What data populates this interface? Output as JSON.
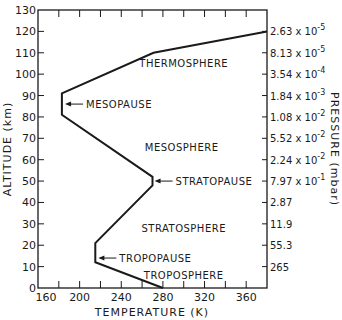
{
  "chart_data": {
    "type": "line",
    "title": "",
    "xlabel": "TEMPERATURE (K)",
    "ylabel": "ALTITUDE (km)",
    "y2label": "PRESSURE (mbar)",
    "xlim": [
      160,
      380
    ],
    "ylim": [
      0,
      130
    ],
    "grid": false,
    "x_ticks": [
      160,
      180,
      200,
      220,
      240,
      260,
      280,
      300,
      320,
      340,
      360,
      380
    ],
    "x_tick_labels": [
      "160",
      "200",
      "240",
      "280",
      "320",
      "360"
    ],
    "x_tick_label_values": [
      160,
      200,
      240,
      280,
      320,
      360
    ],
    "y_ticks": [
      0,
      10,
      20,
      30,
      40,
      50,
      60,
      70,
      80,
      90,
      100,
      110,
      120,
      130
    ],
    "y_tick_labels": [
      "0",
      "10",
      "20",
      "30",
      "40",
      "50",
      "60",
      "70",
      "80",
      "90",
      "100",
      "110",
      "120",
      "130"
    ],
    "series": [
      {
        "name": "Temperature profile",
        "points": [
          {
            "T": 280,
            "alt": 0
          },
          {
            "T": 215,
            "alt": 12
          },
          {
            "T": 215,
            "alt": 21
          },
          {
            "T": 270,
            "alt": 48
          },
          {
            "T": 270,
            "alt": 52
          },
          {
            "T": 183,
            "alt": 81
          },
          {
            "T": 183,
            "alt": 91
          },
          {
            "T": 271,
            "alt": 110
          },
          {
            "T": 380,
            "alt": 120
          }
        ]
      }
    ],
    "pressure_axis": [
      {
        "alt": 120,
        "mantissa": "2.63 x 10",
        "exp": "-5"
      },
      {
        "alt": 110,
        "mantissa": "8.13 x 10",
        "exp": "-5"
      },
      {
        "alt": 100,
        "mantissa": "3.54 x 10",
        "exp": "-4"
      },
      {
        "alt": 90,
        "mantissa": "1.84 x 10",
        "exp": "-3"
      },
      {
        "alt": 80,
        "mantissa": "1.08 x 10",
        "exp": "-2"
      },
      {
        "alt": 70,
        "mantissa": "5.52 x 10",
        "exp": "-2"
      },
      {
        "alt": 60,
        "mantissa": "2.24 x 10",
        "exp": "-2"
      },
      {
        "alt": 50,
        "mantissa": "7.97 x 10",
        "exp": "-1"
      },
      {
        "alt": 40,
        "mantissa": "2.87",
        "exp": ""
      },
      {
        "alt": 30,
        "mantissa": "11.9",
        "exp": ""
      },
      {
        "alt": 20,
        "mantissa": "55.3",
        "exp": ""
      },
      {
        "alt": 10,
        "mantissa": "265",
        "exp": ""
      }
    ],
    "annotations": [
      {
        "text": "THERMOSPHERE",
        "type": "region",
        "T": 300,
        "alt": 105
      },
      {
        "text": "MESOPAUSE",
        "type": "arrow-label",
        "T": 186,
        "alt": 86
      },
      {
        "text": "MESOSPHERE",
        "type": "region",
        "T": 298,
        "alt": 66
      },
      {
        "text": "STRATOPAUSE",
        "type": "arrow-label",
        "T": 272,
        "alt": 50
      },
      {
        "text": "STRATOSPHERE",
        "type": "region",
        "T": 300,
        "alt": 28
      },
      {
        "text": "TROPOPAUSE",
        "type": "arrow-label",
        "T": 218,
        "alt": 14
      },
      {
        "text": "TROPOSPHERE",
        "type": "region",
        "T": 300,
        "alt": 6
      }
    ]
  }
}
